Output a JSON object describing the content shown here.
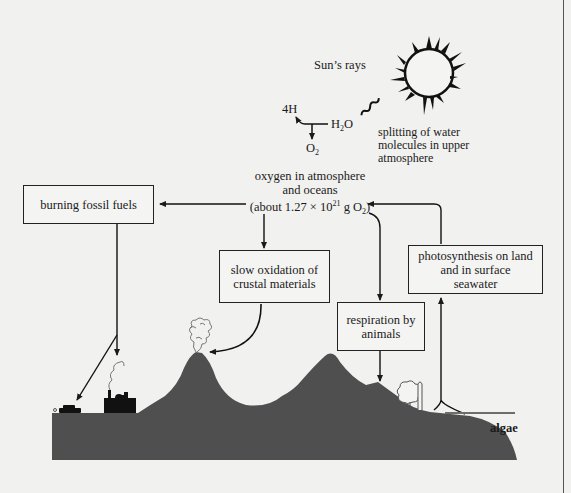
{
  "diagram": {
    "sun": {
      "label": "Sun’s rays",
      "icon": "sun-icon"
    },
    "water_splitting": {
      "products_h": "4H",
      "reactant": {
        "base": "H",
        "sub": "2",
        "tail": "O"
      },
      "product_o2": {
        "base": "O",
        "sub": "2"
      },
      "caption_lines": [
        "splitting of water",
        "molecules in upper",
        "atmosphere"
      ]
    },
    "reservoir": {
      "line1": "oxygen in atmosphere",
      "line2": "and oceans",
      "line3_prefix": "(about 1.27 × 10",
      "line3_exp": "21",
      "line3_unit": " g O",
      "line3_sub": "2",
      "line3_suffix": ")"
    },
    "boxes": {
      "burning": "burning fossil fuels",
      "oxidation_line1": "slow oxidation of",
      "oxidation_line2": "crustal materials",
      "respiration_line1": "respiration by",
      "respiration_line2": "animals",
      "photosynthesis_line1": "photosynthesis on land",
      "photosynthesis_line2": "and in surface",
      "photosynthesis_line3": "seawater"
    },
    "landscape": {
      "algae_label": "algae",
      "ground_color": "#4f4f4f",
      "water_line_color": "#6d6d6d",
      "elements": [
        "car-icon",
        "factory-icon",
        "volcano-smoke-icon",
        "tree-icon",
        "mountain-shape"
      ]
    },
    "arrows": [
      {
        "from": "reservoir",
        "to": "burning fossil fuels"
      },
      {
        "from": "reservoir",
        "to": "slow oxidation of crustal materials"
      },
      {
        "from": "reservoir",
        "to": "respiration by animals"
      },
      {
        "from": "photosynthesis on land and in surface seawater",
        "to": "reservoir"
      },
      {
        "from": "burning fossil fuels",
        "to": "factory / car"
      },
      {
        "from": "slow oxidation of crustal materials",
        "to": "volcano"
      },
      {
        "from": "respiration by animals",
        "to": "land"
      },
      {
        "from": "land plants and algae",
        "to": "photosynthesis"
      },
      {
        "from": "H2O",
        "to": "4H and O2"
      }
    ]
  }
}
